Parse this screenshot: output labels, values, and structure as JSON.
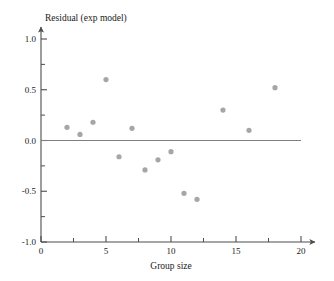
{
  "chart_data": {
    "type": "scatter",
    "title": "",
    "xlabel": "Group size",
    "ylabel": "Residual (exp model)",
    "xlim": [
      0,
      20
    ],
    "ylim": [
      -1.0,
      1.0
    ],
    "grid": false,
    "legend": null,
    "x_major_ticks": [
      0,
      5,
      10,
      15,
      20
    ],
    "x_major_tick_labels": [
      "0",
      "5",
      "10",
      "15",
      "20"
    ],
    "x_minor_ticks": [
      2.5,
      7.5,
      12.5,
      17.5
    ],
    "y_major_ticks": [
      -1.0,
      -0.5,
      0.0,
      0.5,
      1.0
    ],
    "y_major_tick_labels": [
      "-1.0",
      "-0.5",
      "0.0",
      "0.5",
      "1.0"
    ],
    "y_minor_ticks": [
      -0.75,
      -0.25,
      0.25,
      0.75
    ],
    "reference_line": {
      "name": "zero-residual-line",
      "y": 0.0,
      "x_start": 0,
      "x_end": 20,
      "color": "#808080"
    },
    "marker": {
      "shape": "circle",
      "color": "#a6a6a6",
      "size": 4
    },
    "points": [
      {
        "x": 2,
        "y": 0.13
      },
      {
        "x": 3,
        "y": 0.06
      },
      {
        "x": 4,
        "y": 0.18
      },
      {
        "x": 5,
        "y": 0.6
      },
      {
        "x": 6,
        "y": -0.16
      },
      {
        "x": 7,
        "y": 0.12
      },
      {
        "x": 8,
        "y": -0.29
      },
      {
        "x": 9,
        "y": -0.19
      },
      {
        "x": 10,
        "y": -0.11
      },
      {
        "x": 11,
        "y": -0.52
      },
      {
        "x": 12,
        "y": -0.58
      },
      {
        "x": 14,
        "y": 0.3
      },
      {
        "x": 16,
        "y": 0.1
      },
      {
        "x": 18,
        "y": 0.52
      }
    ]
  },
  "axis_colors": {
    "axis_line": "#4d4d4d",
    "text": "#1a1a1a"
  }
}
